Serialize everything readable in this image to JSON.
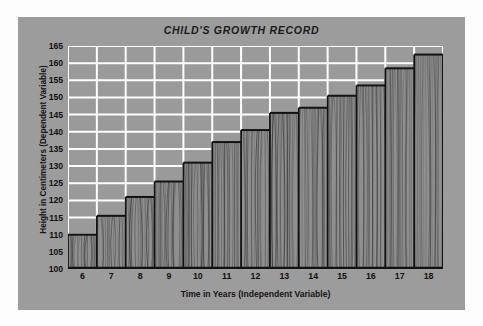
{
  "chart_data": {
    "type": "bar",
    "title": "CHILD'S GROWTH RECORD",
    "xlabel": "Time in Years (Independent Variable)",
    "ylabel": "Height in Centimeters (Dependent Variable)",
    "categories": [
      "6",
      "7",
      "8",
      "9",
      "10",
      "11",
      "12",
      "13",
      "14",
      "15",
      "16",
      "17",
      "18"
    ],
    "values": [
      110,
      115.5,
      121,
      125.5,
      131,
      137,
      140.5,
      145.5,
      147,
      150.5,
      153.5,
      158.5,
      162.5
    ],
    "ylim": [
      100,
      165
    ],
    "ytick_step": 5,
    "yticks": [
      "165",
      "160",
      "155",
      "150",
      "145",
      "140",
      "135",
      "130",
      "125",
      "120",
      "115",
      "110",
      "105",
      "100"
    ],
    "xlim": [
      6,
      19
    ],
    "grid": true,
    "legend": "none",
    "series": [
      {
        "name": "Height",
        "values": [
          110,
          115.5,
          121,
          125.5,
          131,
          137,
          140.5,
          145.5,
          147,
          150.5,
          153.5,
          158.5,
          162.5
        ]
      }
    ],
    "bar_style": "wood-grain-texture"
  },
  "colors": {
    "card_background": "#9c9c9c",
    "plot_background": "#9a9a9a",
    "gridlines": "#ffffff",
    "bar_fill": "#8f8f8f",
    "bar_outline": "#121212",
    "text": "#121212",
    "page_background": "#fdfdfd"
  }
}
